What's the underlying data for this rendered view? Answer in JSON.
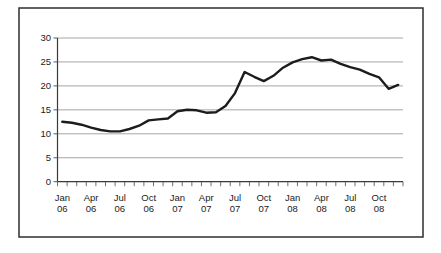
{
  "chart_data": {
    "type": "line",
    "title": "",
    "xlabel": "",
    "ylabel": "",
    "categories": [
      "Jan 06",
      "Feb 06",
      "Mar 06",
      "Apr 06",
      "May 06",
      "Jun 06",
      "Jul 06",
      "Aug 06",
      "Sep 06",
      "Oct 06",
      "Nov 06",
      "Dec 06",
      "Jan 07",
      "Feb 07",
      "Mar 07",
      "Apr 07",
      "May 07",
      "Jun 07",
      "Jul 07",
      "Aug 07",
      "Sep 07",
      "Oct 07",
      "Nov 07",
      "Dec 07",
      "Jan 08",
      "Feb 08",
      "Mar 08",
      "Apr 08",
      "May 08",
      "Jun 08",
      "Jul 08",
      "Aug 08",
      "Sep 08",
      "Oct 08",
      "Nov 08",
      "Dec 08"
    ],
    "values": [
      12.5,
      12.3,
      11.9,
      11.3,
      10.8,
      10.5,
      10.5,
      11.0,
      11.7,
      12.8,
      13.0,
      13.2,
      14.7,
      15.0,
      14.9,
      14.4,
      14.5,
      15.8,
      18.5,
      22.9,
      21.9,
      21.0,
      22.1,
      23.8,
      24.9,
      25.6,
      26.0,
      25.3,
      25.5,
      24.6,
      23.9,
      23.4,
      22.5,
      21.8,
      19.4,
      20.2
    ],
    "ylim": [
      0,
      30
    ],
    "y_ticks": [
      0,
      5,
      10,
      15,
      20,
      25,
      30
    ],
    "x_axis_labels": [
      {
        "month": "Jan",
        "year": "06"
      },
      {
        "month": "Apr",
        "year": "06"
      },
      {
        "month": "Jul",
        "year": "06"
      },
      {
        "month": "Oct",
        "year": "06"
      },
      {
        "month": "Jan",
        "year": "07"
      },
      {
        "month": "Apr",
        "year": "07"
      },
      {
        "month": "Jul",
        "year": "07"
      },
      {
        "month": "Oct",
        "year": "07"
      },
      {
        "month": "Jan",
        "year": "08"
      },
      {
        "month": "Apr",
        "year": "08"
      },
      {
        "month": "Jul",
        "year": "08"
      },
      {
        "month": "Oct",
        "year": "08"
      }
    ],
    "x_label_every_n_months": 3,
    "grid": "horizontal",
    "legend_position": "none",
    "colors": {
      "line": "#1c1c1c",
      "gridline": "#8f8f8f",
      "axis": "#3a3a3a",
      "tick": "#4a4a4a",
      "text": "#222222",
      "frame_border": "#2e2e2e",
      "background": "#ffffff"
    }
  }
}
